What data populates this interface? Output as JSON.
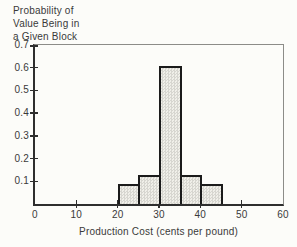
{
  "figure": {
    "y_axis_title_lines": [
      "Probability of",
      "Value Being in",
      "a Given Block"
    ],
    "x_axis_title": "Production Cost (cents per pound)"
  },
  "chart_data": {
    "type": "bar",
    "subtype": "histogram",
    "title": "Probability of Value Being in a Given Block",
    "xlabel": "Production Cost (cents per pound)",
    "ylabel": "Probability of Value Being in a Given Block",
    "xlim": [
      0,
      60
    ],
    "ylim": [
      0,
      0.7
    ],
    "grid": false,
    "legend": false,
    "x_ticks": [
      0,
      10,
      20,
      30,
      40,
      50,
      60
    ],
    "x_tick_labels": [
      "0",
      "10",
      "20",
      "30",
      "40",
      "50",
      "60"
    ],
    "y_ticks": [
      0.1,
      0.2,
      0.3,
      0.4,
      0.5,
      0.6,
      0.7
    ],
    "y_tick_labels": [
      "0.1",
      "0.2",
      "0.3",
      "0.4",
      "0.5",
      "0.6",
      "0.7"
    ],
    "bars": [
      {
        "x_range": [
          20,
          25
        ],
        "probability": 0.08
      },
      {
        "x_range": [
          25,
          30
        ],
        "probability": 0.12
      },
      {
        "x_range": [
          30,
          35
        ],
        "probability": 0.6
      },
      {
        "x_range": [
          35,
          40
        ],
        "probability": 0.12
      },
      {
        "x_range": [
          40,
          45
        ],
        "probability": 0.08
      }
    ],
    "bar_fill_style": "gray-halftone-screen",
    "colors": {
      "background": "#fcfcf9",
      "axis": "#2e2e2e",
      "frame": "#8c8c88",
      "bar_border": "#1b1b1b",
      "bar_fill_light": "#f0efe9",
      "bar_fill_dot": "#d7d6d0",
      "text": "#3a3a3a"
    }
  }
}
